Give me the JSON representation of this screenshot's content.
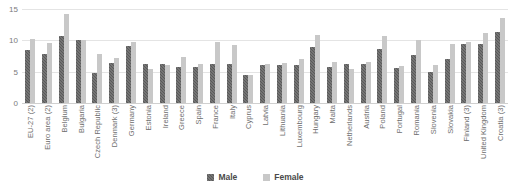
{
  "chart_data": {
    "type": "bar",
    "title": "",
    "xlabel": "",
    "ylabel": "",
    "ylim": [
      0,
      15
    ],
    "yticks": [
      0,
      5,
      10,
      15
    ],
    "ytick_labels": [
      "0",
      "5",
      "10",
      "15"
    ],
    "grid": true,
    "legend_position": "bottom",
    "categories": [
      "EU-27 (2)",
      "Euro area (2)",
      "Belgium",
      "Bulgaria",
      "Czech Republic",
      "Denmark (3)",
      "Germany",
      "Estonia",
      "Ireland",
      "Greece",
      "Spain",
      "France",
      "Italy",
      "Cyprus",
      "Latvia",
      "Lithuania",
      "Luxembourg",
      "Hungary",
      "Malta",
      "Netherlands",
      "Austria",
      "Poland",
      "Portugal",
      "Romania",
      "Slovenia",
      "Slovakia",
      "Finland (3)",
      "United Kingdom",
      "Croatia (3)"
    ],
    "series": [
      {
        "name": "Male",
        "color": "#595959",
        "values": [
          8.4,
          7.9,
          10.7,
          10.0,
          4.8,
          6.4,
          9.1,
          6.2,
          6.2,
          5.8,
          5.7,
          6.3,
          6.3,
          4.4,
          6.1,
          6.1,
          6.1,
          8.9,
          5.7,
          6.2,
          6.3,
          8.6,
          5.6,
          7.6,
          4.9,
          7.1,
          9.4,
          9.4,
          11.4
        ]
      },
      {
        "name": "Female",
        "color": "#c8c8c8",
        "values": [
          10.2,
          9.5,
          14.2,
          10.0,
          7.9,
          7.2,
          9.8,
          5.5,
          6.1,
          7.4,
          6.2,
          9.8,
          9.2,
          4.4,
          6.2,
          6.4,
          7.0,
          10.8,
          6.5,
          5.5,
          6.6,
          10.7,
          5.9,
          10.0,
          6.1,
          9.4,
          9.7,
          11.1,
          13.6
        ]
      }
    ]
  },
  "legend": {
    "items": [
      {
        "label": "Male"
      },
      {
        "label": "Female"
      }
    ]
  }
}
